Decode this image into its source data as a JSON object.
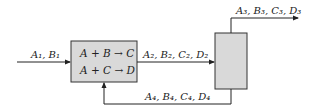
{
  "diagram": {
    "type": "process-flow",
    "colors": {
      "line": "#222222",
      "box_fill": "#d9d9d9",
      "box_stroke": "#333333"
    },
    "reactor": {
      "reactions": [
        "A + B → C",
        "A + C → D"
      ]
    },
    "separator": {
      "label": ""
    },
    "streams": {
      "feed": "A₁, B₁",
      "reactor_out": "A₂, B₂, C₂, D₂",
      "product": "A₃, B₃, C₃, D₃",
      "recycle": "A₄, B₄, C₄, D₄"
    }
  }
}
